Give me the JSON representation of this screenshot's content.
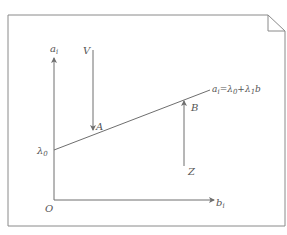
{
  "diagram": {
    "title": "",
    "colors": {
      "stroke": "#6e6e6e",
      "text": "#555555",
      "background": "#ffffff"
    },
    "frame": {
      "style": "page with folded top-right corner"
    },
    "axes": {
      "y_label": {
        "base": "a",
        "sub": "i"
      },
      "x_label": {
        "base": "b",
        "sub": "i"
      },
      "origin_label": "O",
      "intercept_label": {
        "base": "λ",
        "sub": "0"
      }
    },
    "line": {
      "equation": {
        "lhs_base": "a",
        "lhs_sub": "i",
        "eq": "=",
        "t1_base": "λ",
        "t1_sub": "0",
        "plus": "+",
        "t2_base": "λ",
        "t2_sub": "1",
        "t2_var": "b"
      }
    },
    "arrows": [
      {
        "id": "V",
        "label": "V",
        "direction": "down",
        "target_point": "A"
      },
      {
        "id": "Z",
        "label": "Z",
        "direction": "up",
        "target_point": "B"
      }
    ],
    "points": [
      {
        "label": "A"
      },
      {
        "label": "B"
      }
    ]
  }
}
